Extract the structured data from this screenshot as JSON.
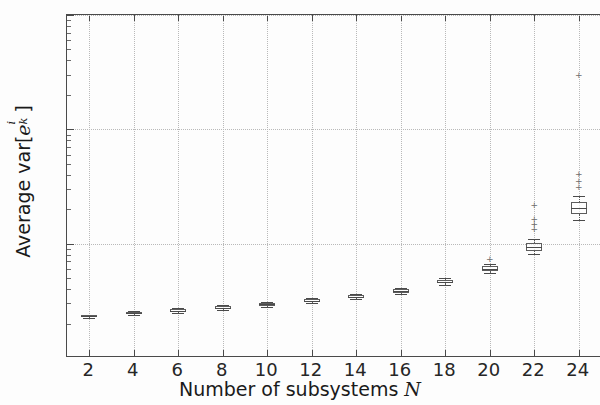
{
  "chart_data": {
    "type": "boxplot",
    "title": "",
    "xlabel": "Number of subsystems N",
    "xlabel_text": "Number of subsystems",
    "xlabel_var": "N",
    "ylabel": "Average var[e_k^i]",
    "ylabel_prefix": "Average var[",
    "ylabel_var": "e",
    "ylabel_sup": "i",
    "ylabel_sub": "k",
    "ylabel_suffix": "]",
    "yscale": "log",
    "ylim": [
      1,
      1000
    ],
    "xlim": [
      1,
      25
    ],
    "grid": true,
    "grid_style": "dotted",
    "legend": "none",
    "y_tick_labels": [
      "10<sup>0</sup>",
      "10<sup>1</sup>",
      "10<sup>2</sup>",
      "10<sup>3</sup>"
    ],
    "y_ticks": [
      1,
      10,
      100,
      1000
    ],
    "y_tick_bases": [
      "10",
      "10",
      "10",
      "10"
    ],
    "y_tick_exps": [
      "0",
      "1",
      "2",
      "3"
    ],
    "categories": [
      2,
      4,
      6,
      8,
      10,
      12,
      14,
      16,
      18,
      20,
      22,
      24
    ],
    "boxes": [
      {
        "x": 2,
        "whislo": 2.25,
        "q1": 2.28,
        "med": 2.32,
        "q3": 2.36,
        "whishi": 2.4,
        "fliers": []
      },
      {
        "x": 4,
        "whislo": 2.38,
        "q1": 2.42,
        "med": 2.46,
        "q3": 2.51,
        "whishi": 2.56,
        "fliers": []
      },
      {
        "x": 6,
        "whislo": 2.5,
        "q1": 2.55,
        "med": 2.6,
        "q3": 2.66,
        "whishi": 2.72,
        "fliers": []
      },
      {
        "x": 8,
        "whislo": 2.64,
        "q1": 2.7,
        "med": 2.76,
        "q3": 2.83,
        "whishi": 2.9,
        "fliers": []
      },
      {
        "x": 10,
        "whislo": 2.8,
        "q1": 2.87,
        "med": 2.94,
        "q3": 3.02,
        "whishi": 3.1,
        "fliers": []
      },
      {
        "x": 12,
        "whislo": 3.0,
        "q1": 3.08,
        "med": 3.16,
        "q3": 3.25,
        "whishi": 3.35,
        "fliers": []
      },
      {
        "x": 14,
        "whislo": 3.25,
        "q1": 3.34,
        "med": 3.44,
        "q3": 3.55,
        "whishi": 3.66,
        "fliers": []
      },
      {
        "x": 16,
        "whislo": 3.62,
        "q1": 3.73,
        "med": 3.85,
        "q3": 3.98,
        "whishi": 4.12,
        "fliers": []
      },
      {
        "x": 18,
        "whislo": 4.35,
        "q1": 4.5,
        "med": 4.66,
        "q3": 4.84,
        "whishi": 5.02,
        "fliers": []
      },
      {
        "x": 20,
        "whislo": 5.5,
        "q1": 5.8,
        "med": 6.05,
        "q3": 6.35,
        "whishi": 6.65,
        "fliers": [
          7.3
        ]
      },
      {
        "x": 22,
        "whislo": 8.1,
        "q1": 8.7,
        "med": 9.3,
        "q3": 10.1,
        "whishi": 11.0,
        "fliers": [
          13.5,
          15.0,
          16.5,
          22.0
        ]
      },
      {
        "x": 24,
        "whislo": 16.0,
        "q1": 18.2,
        "med": 20.5,
        "q3": 23.0,
        "whishi": 26.0,
        "fliers": [
          31.0,
          35.0,
          41.0,
          300.0
        ]
      }
    ]
  },
  "colors": {
    "axis": "#4a4a4a",
    "grid": "#b9b9b9",
    "box_edge": "#5c5c5c",
    "median": "#4a4a4a",
    "flier": "#6e6e6e",
    "background": "#fdfdfd",
    "text": "#1a1a1a"
  }
}
